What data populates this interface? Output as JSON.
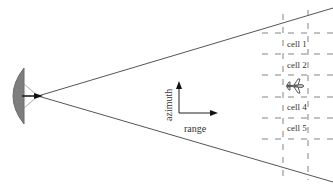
{
  "diagram": {
    "axes": {
      "vertical_label": "azimuth",
      "horizontal_label": "range"
    },
    "cells": [
      {
        "label": "cell 1"
      },
      {
        "label": "cell 2"
      },
      {
        "label": "cell 4"
      },
      {
        "label": "cell 5"
      }
    ],
    "elements": {
      "radar": "radar-dish",
      "beam": "beam-wedge",
      "target": "aircraft"
    },
    "colors": {
      "dish": "#7a7a7a",
      "lines": "#444444",
      "dashes": "#666666"
    }
  }
}
